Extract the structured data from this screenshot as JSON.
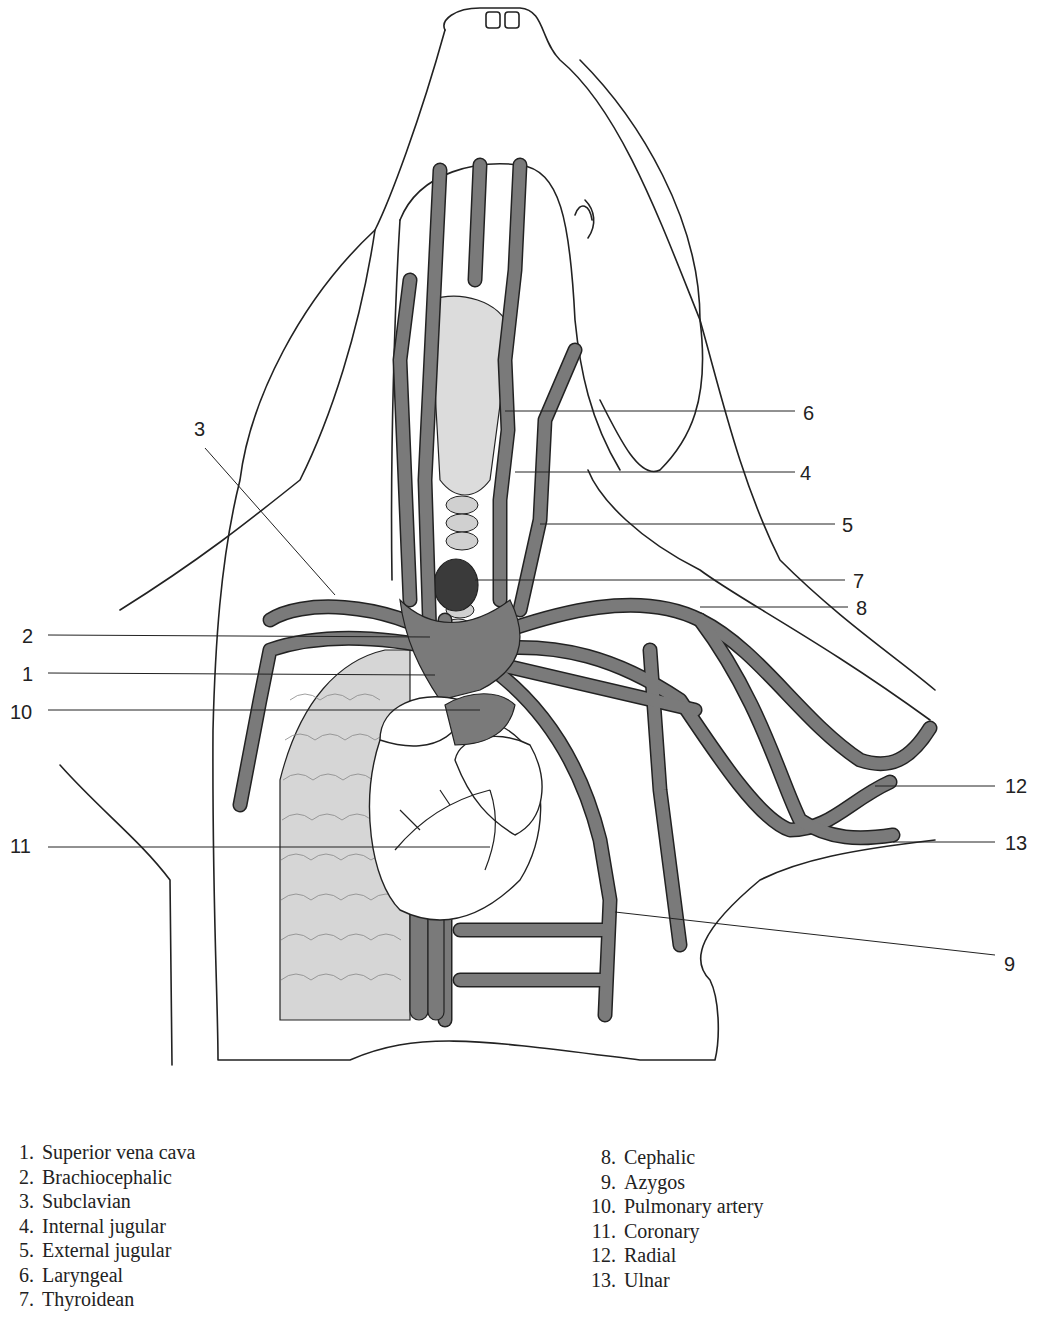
{
  "figure": {
    "colors": {
      "vein_fill": "#7a7a7a",
      "outline": "#222222",
      "lung_fill": "#d6d6d6",
      "trachea_fill": "#dcdcdc",
      "thyroid_fill": "#3a3a3a",
      "heart_fill": "#ffffff",
      "pulmonary_artery_fill": "#7a7a7a"
    }
  },
  "callouts": [
    {
      "number": "1",
      "side": "left",
      "x": 22,
      "y": 673
    },
    {
      "number": "2",
      "side": "left",
      "x": 22,
      "y": 635
    },
    {
      "number": "3",
      "side": "left",
      "x": 194,
      "y": 428
    },
    {
      "number": "10",
      "side": "left",
      "x": 10,
      "y": 711
    },
    {
      "number": "11",
      "side": "left",
      "x": 10,
      "y": 845
    },
    {
      "number": "6",
      "side": "right",
      "x": 803,
      "y": 412
    },
    {
      "number": "4",
      "side": "right",
      "x": 800,
      "y": 472
    },
    {
      "number": "5",
      "side": "right",
      "x": 842,
      "y": 524
    },
    {
      "number": "7",
      "side": "right",
      "x": 853,
      "y": 580
    },
    {
      "number": "8",
      "side": "right",
      "x": 856,
      "y": 607
    },
    {
      "number": "12",
      "side": "right",
      "x": 1005,
      "y": 785
    },
    {
      "number": "13",
      "side": "right",
      "x": 1005,
      "y": 842
    },
    {
      "number": "9",
      "side": "right",
      "x": 1004,
      "y": 963
    }
  ],
  "legend": {
    "left": [
      {
        "num": "1.",
        "label": "Superior vena cava"
      },
      {
        "num": "2.",
        "label": "Brachiocephalic"
      },
      {
        "num": "3.",
        "label": "Subclavian"
      },
      {
        "num": "4.",
        "label": "Internal jugular"
      },
      {
        "num": "5.",
        "label": "External jugular"
      },
      {
        "num": "6.",
        "label": "Laryngeal"
      },
      {
        "num": "7.",
        "label": "Thyroidean"
      }
    ],
    "right": [
      {
        "num": "8.",
        "label": "Cephalic"
      },
      {
        "num": "9.",
        "label": "Azygos"
      },
      {
        "num": "10.",
        "label": "Pulmonary artery"
      },
      {
        "num": "11.",
        "label": "Coronary"
      },
      {
        "num": "12.",
        "label": "Radial"
      },
      {
        "num": "13.",
        "label": "Ulnar"
      }
    ]
  }
}
